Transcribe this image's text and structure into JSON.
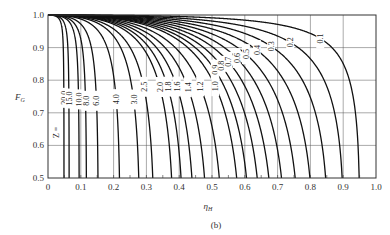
{
  "chart_data": {
    "type": "line",
    "title": "",
    "caption": "(b)",
    "xlabel": "η_H",
    "ylabel": "F_G",
    "xlim": [
      0,
      1.0
    ],
    "ylim": [
      0.5,
      1.0
    ],
    "grid": true,
    "x_ticks": [
      "0",
      "0.1",
      "0.2",
      "0.3",
      "0.4",
      "0.5",
      "0.6",
      "0.7",
      "0.8",
      "0.9",
      "1.0"
    ],
    "y_ticks": [
      "0.5",
      "0.6",
      "0.7",
      "0.8",
      "0.9",
      "1.0"
    ],
    "parameter_name": "Z",
    "series": [
      {
        "name": "Z=20.0",
        "Z": 20.0,
        "label": "20.0",
        "max_eta_at_F0.5": 0.049
      },
      {
        "name": "Z=15.0",
        "Z": 15.0,
        "label": "15.0",
        "max_eta_at_F0.5": 0.066
      },
      {
        "name": "Z=10.0",
        "Z": 10.0,
        "label": "10.0",
        "max_eta_at_F0.5": 0.094
      },
      {
        "name": "Z=8.0",
        "Z": 8.0,
        "label": "8.0",
        "max_eta_at_F0.5": 0.12
      },
      {
        "name": "Z=6.0",
        "Z": 6.0,
        "label": "6.0",
        "max_eta_at_F0.5": 0.166
      },
      {
        "name": "Z=4.0",
        "Z": 4.0,
        "label": "4.0",
        "max_eta_at_F0.5": 0.25
      },
      {
        "name": "Z=3.0",
        "Z": 3.0,
        "label": "3.0",
        "max_eta_at_F0.5": 0.3
      },
      {
        "name": "Z=2.5",
        "Z": 2.5,
        "label": "2.5",
        "max_eta_at_F0.5": 0.35
      },
      {
        "name": "Z=2.0",
        "Z": 2.0,
        "label": "2.0",
        "max_eta_at_F0.5": 0.39
      },
      {
        "name": "Z=1.8",
        "Z": 1.8,
        "label": "1.8",
        "max_eta_at_F0.5": 0.41
      },
      {
        "name": "Z=1.6",
        "Z": 1.6,
        "label": "1.6",
        "max_eta_at_F0.5": 0.46
      },
      {
        "name": "Z=1.4",
        "Z": 1.4,
        "label": "1.4",
        "max_eta_at_F0.5": 0.5
      },
      {
        "name": "Z=1.2",
        "Z": 1.2,
        "label": "1.2",
        "max_eta_at_F0.5": 0.55
      },
      {
        "name": "Z=1.0",
        "Z": 1.0,
        "label": "1.0",
        "max_eta_at_F0.5": 0.61
      },
      {
        "name": "Z=0.9",
        "Z": 0.9,
        "label": "0.9",
        "max_eta_at_F0.5": 0.65
      },
      {
        "name": "Z=0.8",
        "Z": 0.8,
        "label": "0.8",
        "max_eta_at_F0.5": 0.68
      },
      {
        "name": "Z=0.7",
        "Z": 0.7,
        "label": "0.7",
        "max_eta_at_F0.5": 0.72
      },
      {
        "name": "Z=0.6",
        "Z": 0.6,
        "label": "0.6",
        "max_eta_at_F0.5": 0.76
      },
      {
        "name": "Z=0.5",
        "Z": 0.5,
        "label": "0.5",
        "max_eta_at_F0.5": 0.8
      },
      {
        "name": "Z=0.4",
        "Z": 0.4,
        "label": "0.4",
        "max_eta_at_F0.5": 0.84
      },
      {
        "name": "Z=0.3",
        "Z": 0.3,
        "label": "0.3",
        "max_eta_at_F0.5": 0.88
      },
      {
        "name": "Z=0.2",
        "Z": 0.2,
        "label": "0.2",
        "max_eta_at_F0.5": 0.93
      },
      {
        "name": "Z=0.1",
        "Z": 0.1,
        "label": "0.1",
        "max_eta_at_F0.5": 0.97
      }
    ],
    "annotations": [
      "Z = 20.0 (leftmost label prefix)"
    ]
  },
  "labels": {
    "z_prefix": "Z =",
    "x_axis": "η",
    "x_axis_sub": "H",
    "y_axis": "F",
    "y_axis_sub": "G",
    "caption": "(b)"
  },
  "colors": {
    "curve": "#111111",
    "grid": "#555555",
    "frame": "#333333",
    "background": "#ffffff"
  }
}
